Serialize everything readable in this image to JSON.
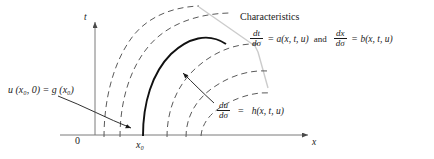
{
  "figure": {
    "type": "method-of-characteristics-diagram",
    "axes": {
      "t_label": "t",
      "x_label": "x",
      "origin_label": "0",
      "x0_label": "x₀"
    },
    "labels": {
      "initial_condition": "u (x₀, 0) = g (x₀)",
      "characteristics_title": "Characteristics"
    },
    "equations": {
      "dt": {
        "num": "dt",
        "den": "dσ",
        "eq": "=",
        "rhs": "a(x, t, u)"
      },
      "conjunction": "and",
      "dx": {
        "num": "dx",
        "den": "dσ",
        "eq": "=",
        "rhs": "b(x, t, u)"
      },
      "du": {
        "num": "du",
        "den": "dσ",
        "eq": "=",
        "rhs": "h(x, t, u)"
      }
    },
    "colors": {
      "ink": "#1a1a1a",
      "dashed_curve": "#555555",
      "solid_curve": "#000000",
      "envelope": "#c8c8c8",
      "axis": "#6f6f6f"
    },
    "curves": {
      "dashed_count": 5,
      "solid_count": 1,
      "solid_starts_at": "x₀"
    }
  }
}
